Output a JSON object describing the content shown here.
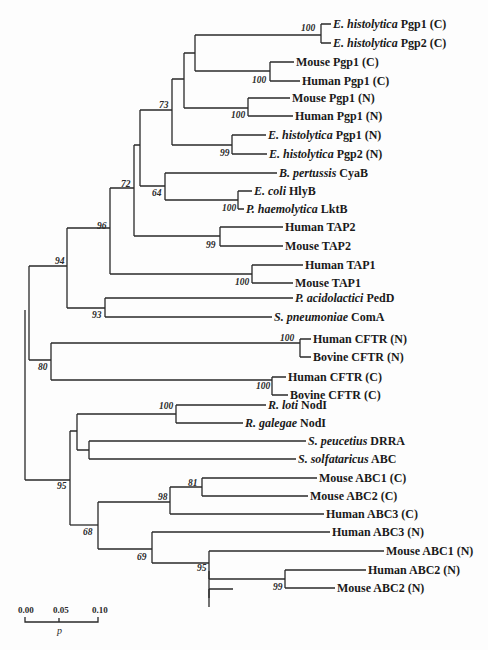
{
  "figure": {
    "type": "phylogenetic-tree",
    "leaves": [
      {
        "species": "E. histolytica",
        "gene": "Pgp1 (C)"
      },
      {
        "species": "E. histolytica",
        "gene": "Pgp2 (C)"
      },
      {
        "species": "",
        "gene": "Mouse Pgp1 (C)"
      },
      {
        "species": "",
        "gene": "Human Pgp1 (C)"
      },
      {
        "species": "",
        "gene": "Mouse Pgp1 (N)"
      },
      {
        "species": "",
        "gene": "Human Pgp1 (N)"
      },
      {
        "species": "E. histolytica",
        "gene": "Pgp1 (N)"
      },
      {
        "species": "E. histolytica",
        "gene": "Pgp2 (N)"
      },
      {
        "species": "B. pertussis",
        "gene": "CyaB"
      },
      {
        "species": "E. coli",
        "gene": "HlyB"
      },
      {
        "species": "P. haemolytica",
        "gene": "LktB"
      },
      {
        "species": "",
        "gene": "Human TAP2"
      },
      {
        "species": "",
        "gene": "Mouse TAP2"
      },
      {
        "species": "",
        "gene": "Human TAP1"
      },
      {
        "species": "",
        "gene": "Mouse TAP1"
      },
      {
        "species": "P. acidolactici",
        "gene": "PedD"
      },
      {
        "species": "S. pneumoniae",
        "gene": "ComA"
      },
      {
        "species": "",
        "gene": "Human CFTR (N)"
      },
      {
        "species": "",
        "gene": "Bovine CFTR (N)"
      },
      {
        "species": "",
        "gene": "Human CFTR (C)"
      },
      {
        "species": "",
        "gene": "Bovine CFTR (C)"
      },
      {
        "species": "R. loti",
        "gene": "NodI"
      },
      {
        "species": "R. galegae",
        "gene": "NodI"
      },
      {
        "species": "S. peucetius",
        "gene": "DRRA"
      },
      {
        "species": "S. solfataricus",
        "gene": "ABC"
      },
      {
        "species": "",
        "gene": "Mouse ABC1 (C)"
      },
      {
        "species": "",
        "gene": "Mouse ABC2 (C)"
      },
      {
        "species": "",
        "gene": "Human ABC3 (C)"
      },
      {
        "species": "",
        "gene": "Human ABC3 (N)"
      },
      {
        "species": "",
        "gene": "Mouse ABC1 (N)"
      },
      {
        "species": "",
        "gene": "Human ABC2 (N)"
      },
      {
        "species": "",
        "gene": "Mouse ABC2 (N)"
      }
    ],
    "bootstrap_values": [
      "100",
      "100",
      "100",
      "99",
      "73",
      "64",
      "100",
      "72",
      "99",
      "100",
      "96",
      "93",
      "94",
      "100",
      "100",
      "80",
      "100",
      "81",
      "98",
      "69",
      "95",
      "99",
      "68",
      "95"
    ],
    "scale_bar": {
      "ticks": [
        "0.00",
        "0.05",
        "0.10"
      ],
      "label": "p"
    }
  }
}
